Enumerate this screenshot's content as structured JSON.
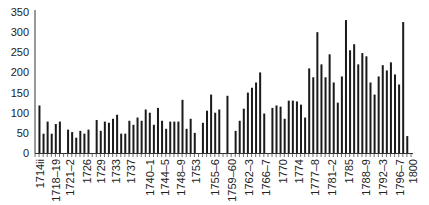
{
  "chart_data": {
    "type": "bar",
    "title": "",
    "xlabel": "",
    "ylabel": "",
    "ylim": [
      0,
      350
    ],
    "yticks": [
      0,
      50,
      100,
      150,
      200,
      250,
      300,
      350
    ],
    "grid": false,
    "legend": null,
    "bar_color": "#1a1a1a",
    "tick_labels": [
      "1714ii",
      "1718–19",
      "1721–2",
      "1726",
      "1729",
      "1733",
      "1737",
      "1740–1",
      "1744–5",
      "1748–9",
      "1753",
      "1755–6",
      "1759–60",
      "1762–3",
      "1766–7",
      "1770",
      "1774",
      "1777–8",
      "1781–2",
      "1785",
      "1788–9",
      "1792–3",
      "1796–7",
      "1800"
    ],
    "groups": [
      {
        "values": [
          118,
          48,
          78,
          48,
          72,
          78
        ]
      },
      {
        "values": [
          58,
          52,
          38,
          55,
          48,
          58
        ]
      },
      {
        "values": [
          82,
          55,
          78,
          75,
          85,
          95,
          48,
          48,
          80,
          70,
          88,
          80,
          108,
          100,
          70,
          112,
          80,
          60,
          78,
          78,
          78,
          132,
          60,
          85,
          50
        ]
      },
      {
        "values": [
          75,
          105,
          145,
          100,
          108
        ]
      },
      {
        "values": [
          142
        ]
      },
      {
        "values": [
          55,
          80,
          110,
          150,
          162,
          175,
          200,
          98
        ]
      },
      {
        "values": [
          112,
          118,
          115,
          85,
          130,
          130,
          128,
          120,
          88,
          210,
          188,
          300,
          220,
          188,
          245,
          175,
          125,
          190,
          330,
          255,
          270,
          220,
          248,
          240,
          175,
          145,
          190,
          218,
          205,
          225,
          195,
          170,
          325,
          42
        ]
      }
    ]
  }
}
